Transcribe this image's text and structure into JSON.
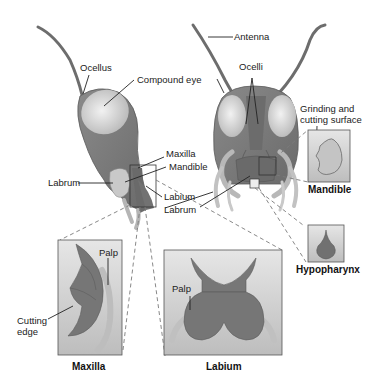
{
  "colors": {
    "head": "#7a7a7a",
    "head_dark": "#5f5f5f",
    "eye": "#d8d8d8",
    "part": "#7d7d7d",
    "appendage_light": "#b9b9b9",
    "box_bg": "#cfcfcf",
    "leader": "#222222",
    "dashed": "#777777"
  },
  "side_view": {
    "labels": {
      "ocellus": "Ocellus",
      "compound_eye": "Compound eye",
      "maxilla": "Maxilla",
      "mandible": "Mandible",
      "labrum": "Labrum",
      "labium": "Labium"
    }
  },
  "front_view": {
    "labels": {
      "antenna": "Antenna",
      "ocelli": "Ocelli",
      "labrum": "Labrum",
      "grinding_line1": "Grinding and",
      "grinding_line2": "cutting surface"
    }
  },
  "insets": {
    "mandible": {
      "caption": "Mandible"
    },
    "hypopharynx": {
      "caption": "Hypopharynx"
    },
    "maxilla": {
      "caption": "Maxilla",
      "palp": "Palp",
      "cutting_line1": "Cutting",
      "cutting_line2": "edge"
    },
    "labium": {
      "caption": "Labium",
      "palp": "Palp"
    }
  }
}
